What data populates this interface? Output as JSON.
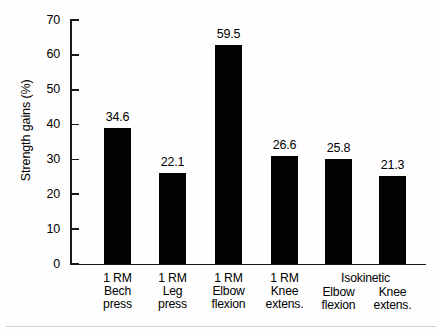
{
  "chart_data": {
    "type": "bar",
    "title": "",
    "xlabel": "",
    "ylabel": "Strength gains (%)",
    "ylim": [
      0,
      70
    ],
    "yticks": [
      0,
      10,
      20,
      30,
      40,
      50,
      60,
      70
    ],
    "ytick_labels": [
      "0",
      "10",
      "20",
      "30",
      "40",
      "50",
      "60",
      "70"
    ],
    "grid": false,
    "legend": null,
    "bar_color": "#030303",
    "axis_color": "#1a1a1a",
    "categories": [
      "1 RM Bech press",
      "1 RM Leg press",
      "1 RM Elbow flexion",
      "1 RM Knee extens.",
      "Isokinetic Elbow flexion",
      "Isokinetic Knee extens."
    ],
    "category_lines": [
      [
        "1 RM",
        "Bech",
        "press"
      ],
      [
        "1 RM",
        "Leg",
        "press"
      ],
      [
        "1 RM",
        "Elbow",
        "flexion"
      ],
      [
        "1 RM",
        "Knee",
        "extens."
      ],
      [
        "Elbow",
        "flexion"
      ],
      [
        "Knee",
        "extens."
      ]
    ],
    "group_header": "Isokinetic",
    "group_header_spans": [
      4,
      5
    ],
    "values": [
      34.6,
      22.1,
      59.5,
      26.6,
      25.8,
      21.3
    ],
    "data_labels": [
      "34.6",
      "22.1",
      "59.5",
      "26.6",
      "25.8",
      "21.3"
    ],
    "plotted_heights": [
      39.0,
      26.0,
      62.8,
      31.0,
      30.2,
      25.2
    ],
    "bars": [
      {
        "label": "34.6",
        "value": 34.6,
        "plotted": 39.0,
        "x": 104,
        "width": 27
      },
      {
        "label": "22.1",
        "value": 22.1,
        "plotted": 26.0,
        "x": 159,
        "width": 27
      },
      {
        "label": "59.5",
        "value": 59.5,
        "plotted": 62.8,
        "x": 215,
        "width": 27
      },
      {
        "label": "26.6",
        "value": 26.6,
        "plotted": 31.0,
        "x": 271,
        "width": 27
      },
      {
        "label": "25.8",
        "value": 25.8,
        "plotted": 30.2,
        "x": 325,
        "width": 27
      },
      {
        "label": "21.3",
        "value": 21.3,
        "plotted": 25.2,
        "x": 379,
        "width": 27
      }
    ]
  }
}
